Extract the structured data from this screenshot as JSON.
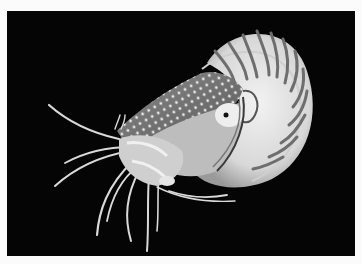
{
  "image": {
    "subject": "chambered nautilus",
    "background_color": "#050505",
    "border_color": "#fbfbfb",
    "tone": "black-and-white"
  }
}
